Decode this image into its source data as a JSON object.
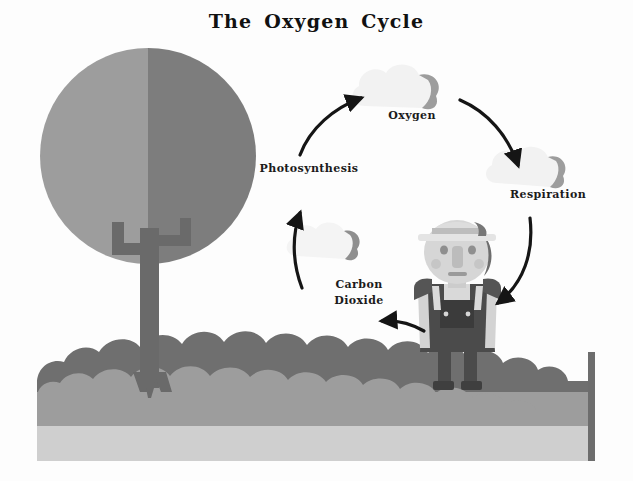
{
  "diagram": {
    "title": "The  Oxygen Cycle",
    "background_color": "#fdfdfd",
    "labels": {
      "photosynthesis": "Photosynthesis",
      "oxygen": "Oxygen",
      "respiration": "Respiration",
      "carbon_dioxide": "Carbon\nDioxide"
    },
    "colors": {
      "canopy_light": "#9a9a9a",
      "canopy_dark": "#7b7b7b",
      "trunk": "#6a6a6a",
      "bush_dark": "#6f6f6f",
      "ground": "#9d9d9d",
      "soil": "#cfcfcf",
      "ground_edge": "#6d6d6d",
      "cloud_light": "#f2f2f2",
      "cloud_shadow": "#9d9d9d",
      "arrow": "#151515",
      "person_skin": "#d6d6d6",
      "person_overalls": "#4b4b4b",
      "person_hat": "#e2e2e2",
      "text": "#1b1b1b"
    },
    "elements": {
      "tree": "tree-with-round-canopy",
      "person": "person-in-overalls-with-hat",
      "clouds": [
        "oxygen-cloud",
        "respiration-cloud",
        "carbon-dioxide-cloud"
      ],
      "arrows": [
        "tree-to-oxygen",
        "oxygen-to-respiration",
        "respiration-to-person",
        "person-to-carbon-dioxide",
        "carbon-dioxide-to-tree"
      ]
    }
  }
}
